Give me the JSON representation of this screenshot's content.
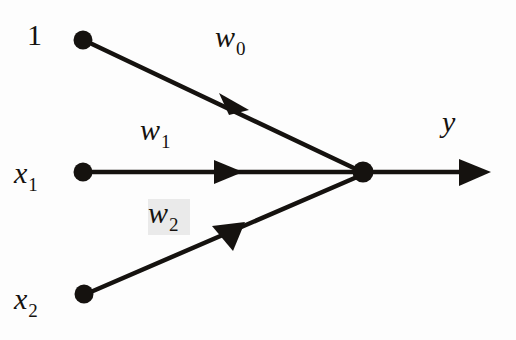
{
  "figure": {
    "background_color": "#fdfdfd",
    "ink_color": "#15120f",
    "smudge_color": "#e9e9e9"
  },
  "nodes": [
    {
      "id": "bias",
      "label": "1",
      "label_sub": "",
      "cx": 83,
      "cy": 40,
      "r": 9,
      "kind": "input-node"
    },
    {
      "id": "x1",
      "label": "x",
      "label_sub": "1",
      "cx": 83,
      "cy": 172,
      "r": 9,
      "kind": "input-node"
    },
    {
      "id": "x2",
      "label": "x",
      "label_sub": "2",
      "cx": 84,
      "cy": 294,
      "r": 9,
      "kind": "input-node"
    },
    {
      "id": "sum",
      "label": "",
      "label_sub": "",
      "cx": 363,
      "cy": 172,
      "r": 10,
      "kind": "summation-node"
    }
  ],
  "edges": [
    {
      "id": "w0",
      "from": "bias",
      "to": "sum",
      "label": "w",
      "label_sub": "0",
      "x1": 92,
      "y1": 44,
      "x2": 358,
      "y2": 170,
      "arrow_t": 0.56
    },
    {
      "id": "w1",
      "from": "x1",
      "to": "sum",
      "label": "w",
      "label_sub": "1",
      "x1": 92,
      "y1": 172,
      "x2": 355,
      "y2": 172,
      "arrow_t": 0.5
    },
    {
      "id": "w2",
      "from": "x2",
      "to": "sum",
      "label": "w",
      "label_sub": "2",
      "x1": 93,
      "y1": 291,
      "x2": 357,
      "y2": 177,
      "arrow_t": 0.51
    }
  ],
  "output": {
    "id": "y",
    "label": "y",
    "label_sub": "",
    "x1": 372,
    "y1": 172,
    "x2": 489,
    "y2": 172
  },
  "labels": {
    "bias_one": "1",
    "x1_base": "x",
    "x1_sub": "1",
    "x2_base": "x",
    "x2_sub": "2",
    "w0_base": "w",
    "w0_sub": "0",
    "w1_base": "w",
    "w1_sub": "1",
    "w2_base": "w",
    "w2_sub": "2",
    "y_base": "y"
  }
}
